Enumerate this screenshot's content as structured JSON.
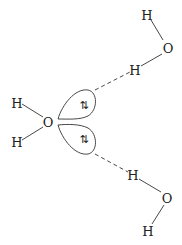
{
  "central_molecule": {
    "oxygen": "O",
    "hydrogens": [
      "H",
      "H"
    ],
    "lone_pairs": [
      {
        "label": "⇅",
        "position": "upper"
      },
      {
        "label": "⇅",
        "position": "lower"
      }
    ]
  },
  "top_molecule": {
    "oxygen": "O",
    "h_outer": "H",
    "h_bonded": "H"
  },
  "bottom_molecule": {
    "oxygen": "O",
    "h_outer": "H",
    "h_bonded": "H"
  },
  "hydrogen_bond_style": "dashed"
}
